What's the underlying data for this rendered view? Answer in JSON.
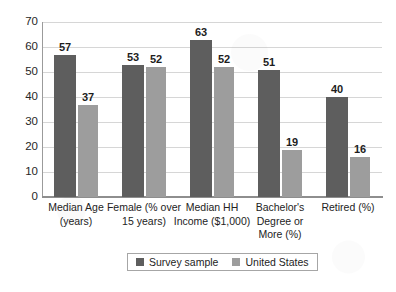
{
  "chart_data": {
    "type": "bar",
    "title": "",
    "subtitle": "",
    "xlabel": "",
    "ylabel": "",
    "ylim": [
      0,
      70
    ],
    "yticks": [
      0,
      10,
      20,
      30,
      40,
      50,
      60,
      70
    ],
    "grid": true,
    "legend_position": "bottom",
    "categories": [
      "Median Age (years)",
      "Female (% over 15 years)",
      "Median HH Income ($1,000)",
      "Bachelor's Degree or More (%)",
      "Retired (%)"
    ],
    "category_lines": [
      [
        "Median Age",
        "(years)"
      ],
      [
        "Female (% over",
        "15 years)"
      ],
      [
        "Median HH",
        "Income ($1,000)"
      ],
      [
        "Bachelor's",
        "Degree or",
        "More (%)"
      ],
      [
        "Retired (%)"
      ]
    ],
    "series": [
      {
        "name": "Survey sample",
        "color": "#5e5e5e",
        "values": [
          57,
          53,
          63,
          51,
          40
        ]
      },
      {
        "name": "United States",
        "color": "#9d9d9d",
        "values": [
          37,
          52,
          52,
          19,
          16
        ]
      }
    ]
  }
}
